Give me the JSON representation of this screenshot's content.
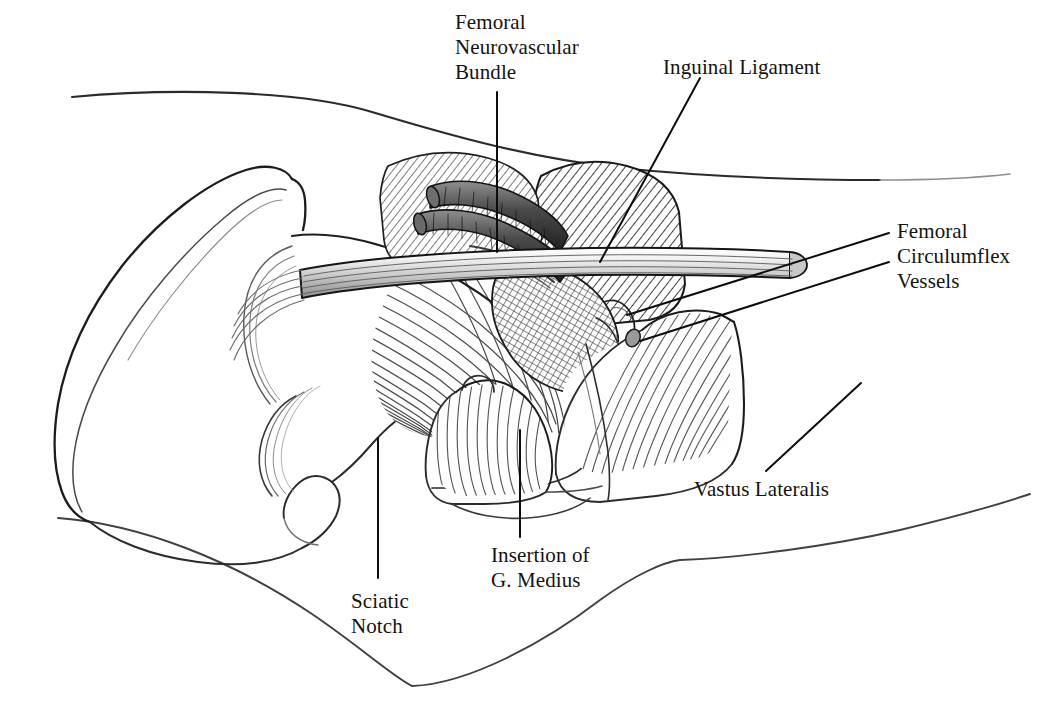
{
  "figure": {
    "kind": "anatomical-line-drawing",
    "background_color": "#ffffff",
    "ink_color": "#1a1a1a",
    "width": 1037,
    "height": 703
  },
  "labels": [
    {
      "id": "femoral-neurovascular-bundle",
      "text": "Femoral\nNeurovascular\nBundle",
      "x": 455,
      "y": 10,
      "align": "left"
    },
    {
      "id": "inguinal-ligament",
      "text": "Inguinal Ligament",
      "x": 663,
      "y": 55,
      "align": "left"
    },
    {
      "id": "femoral-circumflex-vessels",
      "text": "Femoral\nCirculumflex\nVessels",
      "x": 897,
      "y": 219,
      "align": "left"
    },
    {
      "id": "vastus-lateralis",
      "text": "Vastus Lateralis",
      "x": 694,
      "y": 477,
      "align": "left"
    },
    {
      "id": "insertion-of-g-medius",
      "text": "Insertion of\nG. Medius",
      "x": 491,
      "y": 543,
      "align": "left"
    },
    {
      "id": "sciatic-notch",
      "text": "Sciatic\nNotch",
      "x": 351,
      "y": 589,
      "align": "left"
    }
  ],
  "leader_lines": [
    {
      "id": "leader-femoral-neurovascular-bundle",
      "from": [
        497,
        92
      ],
      "to": [
        497,
        252
      ]
    },
    {
      "id": "leader-inguinal-ligament",
      "from": [
        700,
        78
      ],
      "to": [
        600,
        262
      ]
    },
    {
      "id": "leader-femoral-circumflex-upper",
      "from": [
        889,
        233
      ],
      "to": [
        627,
        315
      ]
    },
    {
      "id": "leader-femoral-circumflex-lower",
      "from": [
        889,
        262
      ],
      "to": [
        640,
        341
      ]
    },
    {
      "id": "leader-vastus-lateralis",
      "from": [
        766,
        471
      ],
      "to": [
        861,
        383
      ]
    },
    {
      "id": "leader-insertion-g-medius",
      "from": [
        520,
        537
      ],
      "to": [
        520,
        430
      ]
    },
    {
      "id": "leader-sciatic-notch",
      "from": [
        378,
        578
      ],
      "to": [
        378,
        438
      ]
    }
  ],
  "anatomy_parts": [
    {
      "id": "iliac-crest",
      "name": "Iliac crest / wing of ilium"
    },
    {
      "id": "body-contour-upper",
      "name": "Upper torso skin contour"
    },
    {
      "id": "body-contour-lower",
      "name": "Lower thigh skin contour"
    },
    {
      "id": "gluteus-medius",
      "name": "Gluteus medius muscle fan"
    },
    {
      "id": "tensor-fascia-lata",
      "name": "Tensor fascia lata / hatched region"
    },
    {
      "id": "inguinal-ligament-band",
      "name": "Inguinal ligament band"
    },
    {
      "id": "femoral-vessels",
      "name": "Femoral artery and vein cylinders"
    },
    {
      "id": "vastus-lateralis-muscle",
      "name": "Vastus lateralis muscle belly"
    },
    {
      "id": "g-medius-insertion",
      "name": "Insertion of gluteus medius on greater trochanter"
    },
    {
      "id": "sciatic-notch-region",
      "name": "Greater sciatic notch"
    },
    {
      "id": "rectus-femoris",
      "name": "Rectus femoris / sartorius hatched block"
    }
  ]
}
